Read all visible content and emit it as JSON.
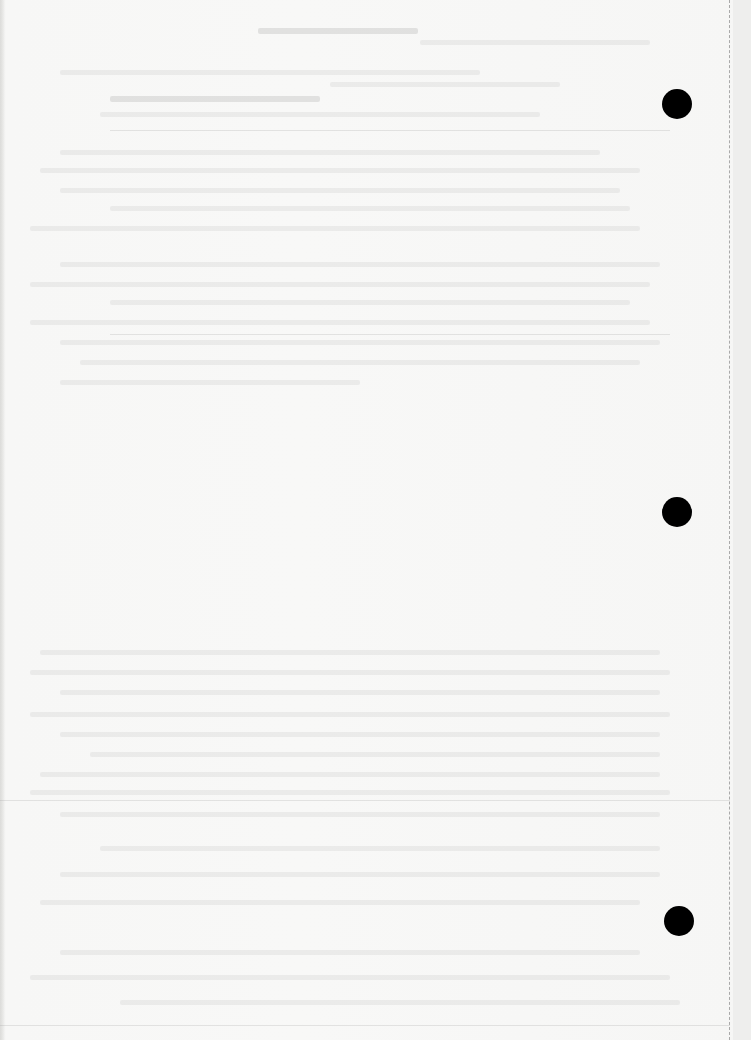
{
  "document": {
    "type": "scanned blank page",
    "background_color": "#f6f6f5",
    "visible_text": "",
    "note_on_text": "Only faint, illegible show-through text from the reverse side is visible"
  },
  "punch_holes": [
    {
      "label": "top-hole",
      "cx": 677,
      "cy": 104,
      "diameter": 30,
      "color": "#000000"
    },
    {
      "label": "middle-hole",
      "cx": 677,
      "cy": 512,
      "diameter": 30,
      "color": "#000000"
    },
    {
      "label": "bottom-hole",
      "cx": 679,
      "cy": 921,
      "diameter": 30,
      "color": "#000000"
    }
  ],
  "perforation_line": {
    "x": 729,
    "style": "dashed",
    "color": "#a9a9a9"
  },
  "ghost_text_blocks": [
    {
      "y": 28,
      "x": 258,
      "w": 160,
      "dark": true
    },
    {
      "y": 40,
      "x": 420,
      "w": 230,
      "dark": false
    },
    {
      "y": 70,
      "x": 60,
      "w": 420,
      "dark": false
    },
    {
      "y": 82,
      "x": 330,
      "w": 230,
      "dark": false
    },
    {
      "y": 96,
      "x": 110,
      "w": 210,
      "dark": true
    },
    {
      "y": 112,
      "x": 100,
      "w": 440,
      "dark": false
    },
    {
      "y": 150,
      "x": 60,
      "w": 540,
      "dark": false
    },
    {
      "y": 168,
      "x": 40,
      "w": 600,
      "dark": false
    },
    {
      "y": 188,
      "x": 60,
      "w": 560,
      "dark": false
    },
    {
      "y": 206,
      "x": 110,
      "w": 520,
      "dark": false
    },
    {
      "y": 226,
      "x": 30,
      "w": 610,
      "dark": false
    },
    {
      "y": 262,
      "x": 60,
      "w": 600,
      "dark": false
    },
    {
      "y": 282,
      "x": 30,
      "w": 620,
      "dark": false
    },
    {
      "y": 300,
      "x": 110,
      "w": 520,
      "dark": false
    },
    {
      "y": 320,
      "x": 30,
      "w": 620,
      "dark": false
    },
    {
      "y": 340,
      "x": 60,
      "w": 600,
      "dark": false
    },
    {
      "y": 360,
      "x": 80,
      "w": 560,
      "dark": false
    },
    {
      "y": 380,
      "x": 60,
      "w": 300,
      "dark": false
    },
    {
      "y": 650,
      "x": 40,
      "w": 620,
      "dark": false
    },
    {
      "y": 670,
      "x": 30,
      "w": 640,
      "dark": false
    },
    {
      "y": 690,
      "x": 60,
      "w": 600,
      "dark": false
    },
    {
      "y": 712,
      "x": 30,
      "w": 640,
      "dark": false
    },
    {
      "y": 732,
      "x": 60,
      "w": 600,
      "dark": false
    },
    {
      "y": 752,
      "x": 90,
      "w": 570,
      "dark": false
    },
    {
      "y": 772,
      "x": 40,
      "w": 620,
      "dark": false
    },
    {
      "y": 790,
      "x": 30,
      "w": 640,
      "dark": false
    },
    {
      "y": 812,
      "x": 60,
      "w": 600,
      "dark": false
    },
    {
      "y": 846,
      "x": 100,
      "w": 560,
      "dark": false
    },
    {
      "y": 872,
      "x": 60,
      "w": 600,
      "dark": false
    },
    {
      "y": 900,
      "x": 40,
      "w": 600,
      "dark": false
    },
    {
      "y": 950,
      "x": 60,
      "w": 580,
      "dark": false
    },
    {
      "y": 975,
      "x": 30,
      "w": 640,
      "dark": false
    },
    {
      "y": 1000,
      "x": 120,
      "w": 560,
      "dark": false
    }
  ],
  "rules": [
    {
      "y": 130,
      "x": 110,
      "w": 560
    },
    {
      "y": 334,
      "x": 110,
      "w": 560
    },
    {
      "y": 800,
      "x": 0,
      "w": 730
    },
    {
      "y": 1025,
      "x": 0,
      "w": 730
    }
  ]
}
